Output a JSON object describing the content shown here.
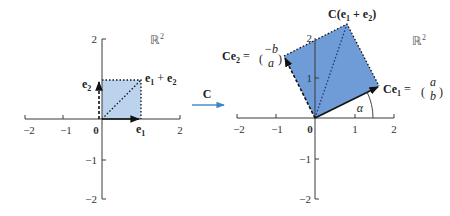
{
  "figure": {
    "type": "linear-transformation-diagram",
    "transform_label": "C",
    "transform_arrow_color": "#3a86c8"
  },
  "left_plot": {
    "space_label": "ℝ",
    "space_sup": "2",
    "x_ticks": [
      "−2",
      "−1",
      "0",
      "1",
      "2"
    ],
    "y_ticks": [
      "2",
      "−1",
      "−2"
    ],
    "fill_color": "#bcd3ee",
    "vectors": {
      "e1": {
        "label": "e",
        "sub": "1"
      },
      "e2": {
        "label": "e",
        "sub": "2"
      },
      "sum": {
        "label_a": "e",
        "sub_a": "1",
        "plus": " + ",
        "label_b": "e",
        "sub_b": "2"
      }
    }
  },
  "right_plot": {
    "space_label": "ℝ",
    "space_sup": "2",
    "x_ticks": [
      "−2",
      "−1",
      "0",
      "1",
      "2"
    ],
    "y_ticks": [
      "2",
      "1",
      "−1",
      "−2"
    ],
    "fill_color": "#6f9bd6",
    "angle_label": "α",
    "vectors": {
      "Ce1": {
        "prefix": "Ce",
        "sub": "1",
        "eq": " = ",
        "top": "a",
        "bottom": "b"
      },
      "Ce2": {
        "prefix": "Ce",
        "sub": "2",
        "eq": " = ",
        "top": "−b",
        "bottom": "a"
      },
      "Csum": {
        "text": "C(e",
        "sub_a": "1",
        "plus": " + e",
        "sub_b": "2",
        "close": ")"
      }
    }
  }
}
